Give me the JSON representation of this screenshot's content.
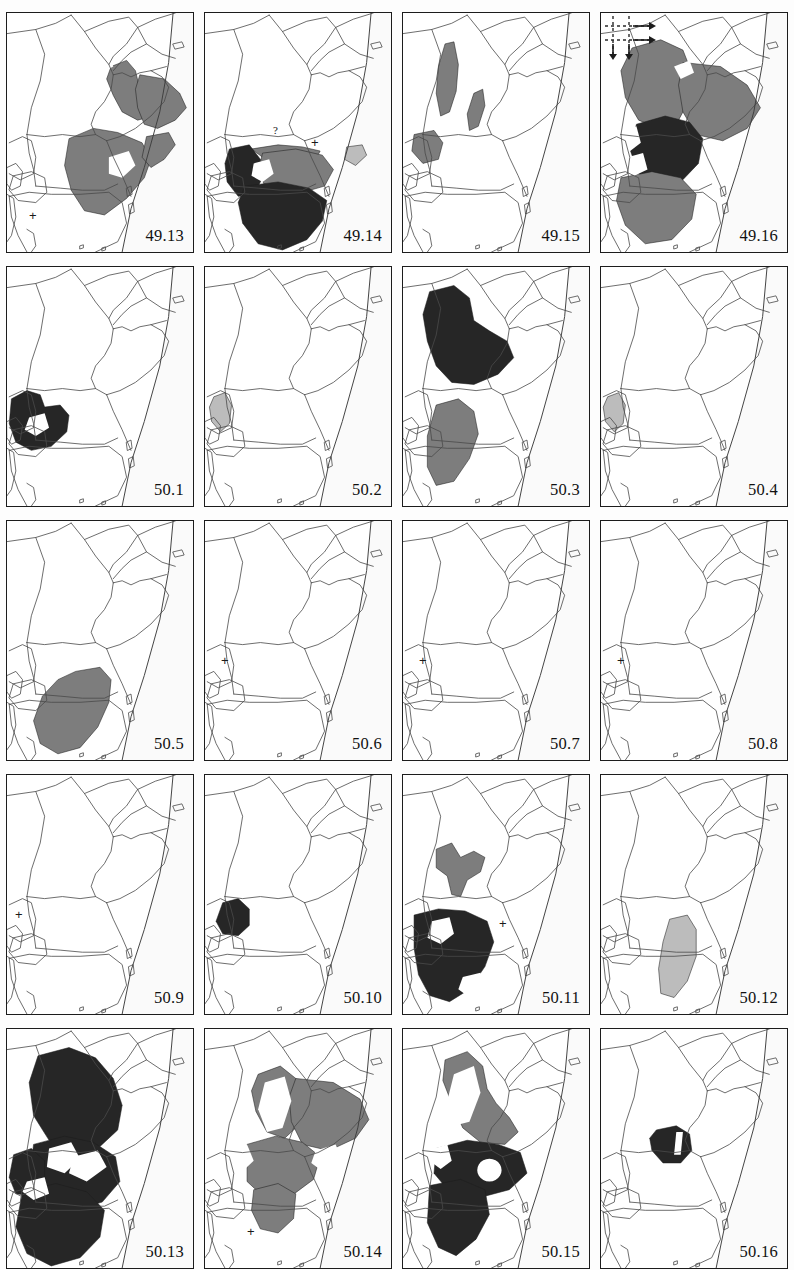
{
  "header": {
    "title": ""
  },
  "legend": {
    "fill_black": "#262626",
    "fill_dark_gray": "#7d7d7d",
    "fill_light_gray": "#bcbcbc",
    "coastline": "#ffffff",
    "border_line": "#4a4a4a",
    "panel_border": "#1c1c1c",
    "sea": "#fafafa"
  },
  "grid": {
    "columns": 4,
    "rows": 5
  },
  "panels": [
    {
      "label": "49.13",
      "marks": [
        {
          "type": "plus",
          "text": "+",
          "x": 22,
          "y": 196
        }
      ],
      "scan_symbol": false,
      "shapes": [
        {
          "name": "ethiopia-highland-range",
          "fill": "dark",
          "d": "M94 52 L108 46 L116 56 L120 74 L124 92 L132 100 L118 104 L104 96 L96 80 L90 64 Z"
        },
        {
          "name": "somalia-range",
          "fill": "dark",
          "d": "M120 60 L142 64 L156 78 L162 92 L152 104 L136 112 L124 108 L118 92 L116 74 Z"
        },
        {
          "name": "kenya-range",
          "fill": "dark",
          "d": "M56 122 L78 112 L100 116 L122 126 L130 142 L124 160 L108 180 L88 196 L70 192 L58 172 L52 148 Z"
        },
        {
          "name": "coast-range-strip",
          "fill": "dark",
          "d": "M126 120 L146 116 L152 128 L142 142 L130 150 L122 140 Z"
        },
        {
          "name": "interior-void-1",
          "fill": "white",
          "d": "M66 78 L82 70 L90 86 L86 104 L74 110 L64 98 Z"
        },
        {
          "name": "interior-void-2",
          "fill": "white",
          "d": "M92 140 L110 134 L116 148 L104 160 L92 156 Z"
        },
        {
          "name": "coast-void",
          "fill": "white",
          "d": "M78 46 L92 40 L96 52 L86 58 Z"
        }
      ]
    },
    {
      "label": "49.14",
      "marks": [
        {
          "type": "question",
          "text": "?",
          "x": 68,
          "y": 112
        },
        {
          "type": "plus",
          "text": "+",
          "x": 106,
          "y": 123
        }
      ],
      "scan_symbol": false,
      "shapes": [
        {
          "name": "narrow-coast-band",
          "fill": "dark",
          "d": "M42 132 L66 128 L88 130 L104 134 L100 142 L76 142 L52 140 Z"
        },
        {
          "name": "somali-coast-patch",
          "fill": "light",
          "d": "M128 130 L142 128 L146 138 L136 148 L126 142 Z"
        },
        {
          "name": "uganda-range",
          "fill": "black",
          "d": "M22 132 L40 128 L50 142 L52 160 L44 176 L30 178 L20 164 L18 146 Z"
        },
        {
          "name": "kenya-range",
          "fill": "dark",
          "d": "M52 136 L82 132 L106 138 L116 152 L108 168 L82 176 L56 172 L48 154 Z"
        },
        {
          "name": "tanzania-range",
          "fill": "black",
          "d": "M36 168 L66 164 L94 170 L110 182 L106 202 L92 220 L70 230 L48 224 L34 204 L30 184 Z"
        },
        {
          "name": "lake-void",
          "fill": "white",
          "d": "M44 146 L58 142 L62 156 L52 164 L42 158 Z"
        }
      ]
    },
    {
      "label": "49.15",
      "marks": [],
      "scan_symbol": false,
      "shapes": [
        {
          "name": "rift-strip-west",
          "fill": "dark",
          "d": "M38 30 L46 28 L50 50 L48 76 L42 96 L34 100 L30 78 L32 52 Z"
        },
        {
          "name": "rift-strip-east",
          "fill": "dark",
          "d": "M64 78 L72 74 L74 90 L68 110 L60 114 L58 98 Z"
        },
        {
          "name": "west-lake-range",
          "fill": "dark",
          "d": "M10 118 L28 114 L36 126 L32 142 L18 146 L8 134 Z"
        }
      ]
    },
    {
      "label": "49.16",
      "marks": [],
      "scan_symbol": true,
      "shapes": [
        {
          "name": "ethiopia-range",
          "fill": "dark",
          "d": "M28 34 L54 26 L74 36 L82 58 L80 84 L70 104 L52 112 L34 104 L22 82 L18 56 Z"
        },
        {
          "name": "somalia-range",
          "fill": "dark",
          "d": "M74 48 L108 52 L132 70 L144 92 L132 112 L110 124 L86 118 L74 96 L70 70 Z"
        },
        {
          "name": "kenya-range",
          "fill": "black",
          "d": "M32 108 L58 100 L80 106 L92 122 L88 146 L72 164 L50 168 L34 156 L26 132 Z"
        },
        {
          "name": "tanzania-range",
          "fill": "dark",
          "d": "M18 160 L46 154 L72 160 L86 176 L82 200 L64 220 L40 224 L22 206 L14 182 Z"
        },
        {
          "name": "lake-void-1",
          "fill": "white",
          "d": "M16 116 L32 110 L36 126 L24 136 L12 130 Z"
        },
        {
          "name": "lake-void-2",
          "fill": "white",
          "d": "M24 140 L38 136 L42 152 L30 158 L20 150 Z"
        },
        {
          "name": "coast-void",
          "fill": "white",
          "d": "M66 52 L80 46 L84 58 L72 64 Z"
        }
      ]
    },
    {
      "label": "50.1",
      "marks": [],
      "scan_symbol": false,
      "shapes": [
        {
          "name": "lake-victoria-range",
          "fill": "black",
          "d": "M4 128 L18 120 L30 124 L34 136 L48 134 L56 144 L54 160 L40 174 L22 178 L8 170 L2 152 Z"
        },
        {
          "name": "lake-void",
          "fill": "white",
          "d": "M20 146 L34 142 L38 156 L26 164 L16 158 Z"
        }
      ]
    },
    {
      "label": "50.2",
      "marks": [],
      "scan_symbol": false,
      "shapes": [
        {
          "name": "rwanda-burundi-range",
          "fill": "light",
          "d": "M8 126 L18 122 L24 134 L22 152 L14 160 L6 150 L4 136 Z"
        }
      ]
    },
    {
      "label": "50.3",
      "marks": [],
      "scan_symbol": false,
      "shapes": [
        {
          "name": "ethiopia-range",
          "fill": "black",
          "d": "M24 24 L46 18 L60 30 L64 52 L78 62 L94 72 L100 88 L86 104 L64 114 L44 112 L30 96 L22 72 L18 46 Z"
        },
        {
          "name": "tanzania-range",
          "fill": "dark",
          "d": "M30 134 L50 128 L64 140 L68 162 L60 186 L46 208 L30 212 L22 194 L22 164 Z"
        }
      ]
    },
    {
      "label": "50.4",
      "marks": [],
      "scan_symbol": false,
      "shapes": [
        {
          "name": "rwanda-burundi-range",
          "fill": "light",
          "d": "M6 126 L16 122 L22 134 L20 152 L12 160 L4 150 L2 136 Z"
        }
      ]
    },
    {
      "label": "50.5",
      "marks": [],
      "scan_symbol": false,
      "shapes": [
        {
          "name": "tanzania-range",
          "fill": "dark",
          "d": "M62 146 L84 142 L94 154 L92 176 L82 200 L66 220 L46 226 L30 216 L24 194 L32 170 L46 154 Z"
        }
      ]
    },
    {
      "label": "50.6",
      "marks": [
        {
          "type": "plus",
          "text": "+",
          "x": 16,
          "y": 133
        }
      ],
      "scan_symbol": false,
      "shapes": []
    },
    {
      "label": "50.7",
      "marks": [
        {
          "type": "plus",
          "text": "+",
          "x": 16,
          "y": 133
        }
      ],
      "scan_symbol": false,
      "shapes": []
    },
    {
      "label": "50.8",
      "marks": [
        {
          "type": "plus",
          "text": "+",
          "x": 16,
          "y": 133
        }
      ],
      "scan_symbol": false,
      "shapes": []
    },
    {
      "label": "50.9",
      "marks": [
        {
          "type": "plus",
          "text": "+",
          "x": 8,
          "y": 133
        }
      ],
      "scan_symbol": false,
      "shapes": []
    },
    {
      "label": "50.10",
      "marks": [],
      "scan_symbol": false,
      "shapes": [
        {
          "name": "uganda-range",
          "fill": "black",
          "d": "M16 124 L30 120 L40 130 L40 146 L30 156 L16 154 L10 142 Z"
        }
      ]
    },
    {
      "label": "50.11",
      "marks": [
        {
          "type": "plus",
          "text": "+",
          "x": 96,
          "y": 142
        }
      ],
      "scan_symbol": false,
      "shapes": [
        {
          "name": "ethiopia-range",
          "fill": "dark",
          "d": "M30 72 L44 66 L52 80 L64 74 L74 80 L70 94 L58 102 L52 118 L44 116 L40 98 L30 90 Z"
        },
        {
          "name": "lake-victoria-range",
          "fill": "black",
          "d": "M10 136 L32 130 L56 132 L76 142 L82 162 L74 186 L60 208 L42 220 L24 214 L14 194 L10 168 Z"
        },
        {
          "name": "lake-void-1",
          "fill": "white",
          "d": "M26 142 L42 138 L46 154 L34 164 L22 158 Z"
        },
        {
          "name": "lake-void-2",
          "fill": "white",
          "d": "M54 196 L70 192 L74 208 L60 216 L50 208 Z"
        }
      ]
    },
    {
      "label": "50.12",
      "marks": [],
      "scan_symbol": false,
      "shapes": [
        {
          "name": "coastal-tanzania-range",
          "fill": "light",
          "d": "M62 140 L78 136 L86 150 L86 176 L78 200 L66 216 L54 212 L52 188 L56 162 Z"
        }
      ]
    },
    {
      "label": "50.13",
      "marks": [],
      "scan_symbol": false,
      "shapes": [
        {
          "name": "ethiopia-range",
          "fill": "black",
          "d": "M28 26 L56 18 L80 28 L96 48 L104 74 L100 98 L84 114 L60 118 L38 108 L24 84 L20 52 Z"
        },
        {
          "name": "kenya-range",
          "fill": "black",
          "d": "M24 112 L52 104 L78 110 L98 124 L102 148 L86 168 L60 176 L34 168 L20 146 Z"
        },
        {
          "name": "uganda-range",
          "fill": "black",
          "d": "M6 122 L22 116 L34 128 L34 148 L24 162 L8 160 L2 144 Z"
        },
        {
          "name": "tanzania-range",
          "fill": "black",
          "d": "M14 158 L44 150 L72 158 L88 176 L84 202 L66 222 L40 230 L18 218 L8 192 Z"
        },
        {
          "name": "lake-void-1",
          "fill": "white",
          "d": "M38 116 L58 110 L66 126 L52 140 L36 134 Z"
        },
        {
          "name": "lake-void-2",
          "fill": "white",
          "d": "M60 124 L82 118 L90 134 L72 148 L56 140 Z"
        },
        {
          "name": "lake-void-3",
          "fill": "white",
          "d": "M18 148 L34 144 L38 160 L24 166 L14 158 Z"
        }
      ]
    },
    {
      "label": "50.14",
      "marks": [
        {
          "type": "plus",
          "text": "+",
          "x": 42,
          "y": 196
        }
      ],
      "scan_symbol": false,
      "shapes": [
        {
          "name": "ethiopia-range",
          "fill": "dark",
          "d": "M48 44 L68 36 L82 48 L88 70 L84 94 L72 106 L56 100 L46 80 L42 60 Z"
        },
        {
          "name": "somalia-range",
          "fill": "dark",
          "d": "M82 48 L116 52 L140 68 L148 88 L136 106 L112 118 L88 112 L78 90 L76 66 Z"
        },
        {
          "name": "kenya-range",
          "fill": "dark",
          "d": "M38 112 L64 104 L88 110 L104 124 L98 146 L78 162 L54 164 L38 148 Z"
        },
        {
          "name": "tanzania-range",
          "fill": "dark",
          "d": "M44 156 L66 150 L82 160 L80 184 L66 198 L50 194 L42 176 Z"
        },
        {
          "name": "rift-void",
          "fill": "white",
          "d": "M54 52 L72 46 L78 70 L70 96 L56 100 L48 78 Z"
        },
        {
          "name": "coast-void",
          "fill": "white",
          "d": "M100 118 L118 112 L124 128 L106 138 L96 130 Z"
        },
        {
          "name": "west-void",
          "fill": "white",
          "d": "M22 118 L38 112 L44 128 L32 140 L20 132 Z"
        }
      ]
    },
    {
      "label": "50.15",
      "marks": [],
      "scan_symbol": false,
      "shapes": [
        {
          "name": "ethiopia-range",
          "fill": "dark",
          "d": "M38 30 L58 22 L72 36 L76 58 L84 72 L96 86 L104 100 L92 112 L70 110 L54 96 L44 72 L36 50 Z"
        },
        {
          "name": "kenya-range",
          "fill": "black",
          "d": "M30 116 L58 108 L86 112 L106 120 L112 140 L96 156 L68 164 L42 158 L28 140 Z"
        },
        {
          "name": "tanzania-range",
          "fill": "black",
          "d": "M24 152 L52 146 L74 156 L78 180 L66 204 L48 220 L32 212 L22 188 Z"
        },
        {
          "name": "rift-void",
          "fill": "white",
          "d": "M46 44 L64 36 L70 62 L60 90 L46 94 L40 70 Z"
        },
        {
          "name": "circle-void",
          "fill": "white",
          "d": "M78 126 a11 11 0 1 0 0.1 0 Z"
        },
        {
          "name": "west-void",
          "fill": "white",
          "d": "M28 116 L40 112 L44 128 L34 136 L24 128 Z"
        }
      ]
    },
    {
      "label": "50.16",
      "marks": [],
      "scan_symbol": false,
      "shapes": [
        {
          "name": "small-kenya-range",
          "fill": "black",
          "d": "M50 98 L68 94 L80 102 L82 118 L72 130 L56 130 L46 118 L44 106 Z"
        },
        {
          "name": "thin-void",
          "fill": "white",
          "d": "M68 100 L74 100 L72 122 L66 122 Z"
        }
      ]
    }
  ]
}
